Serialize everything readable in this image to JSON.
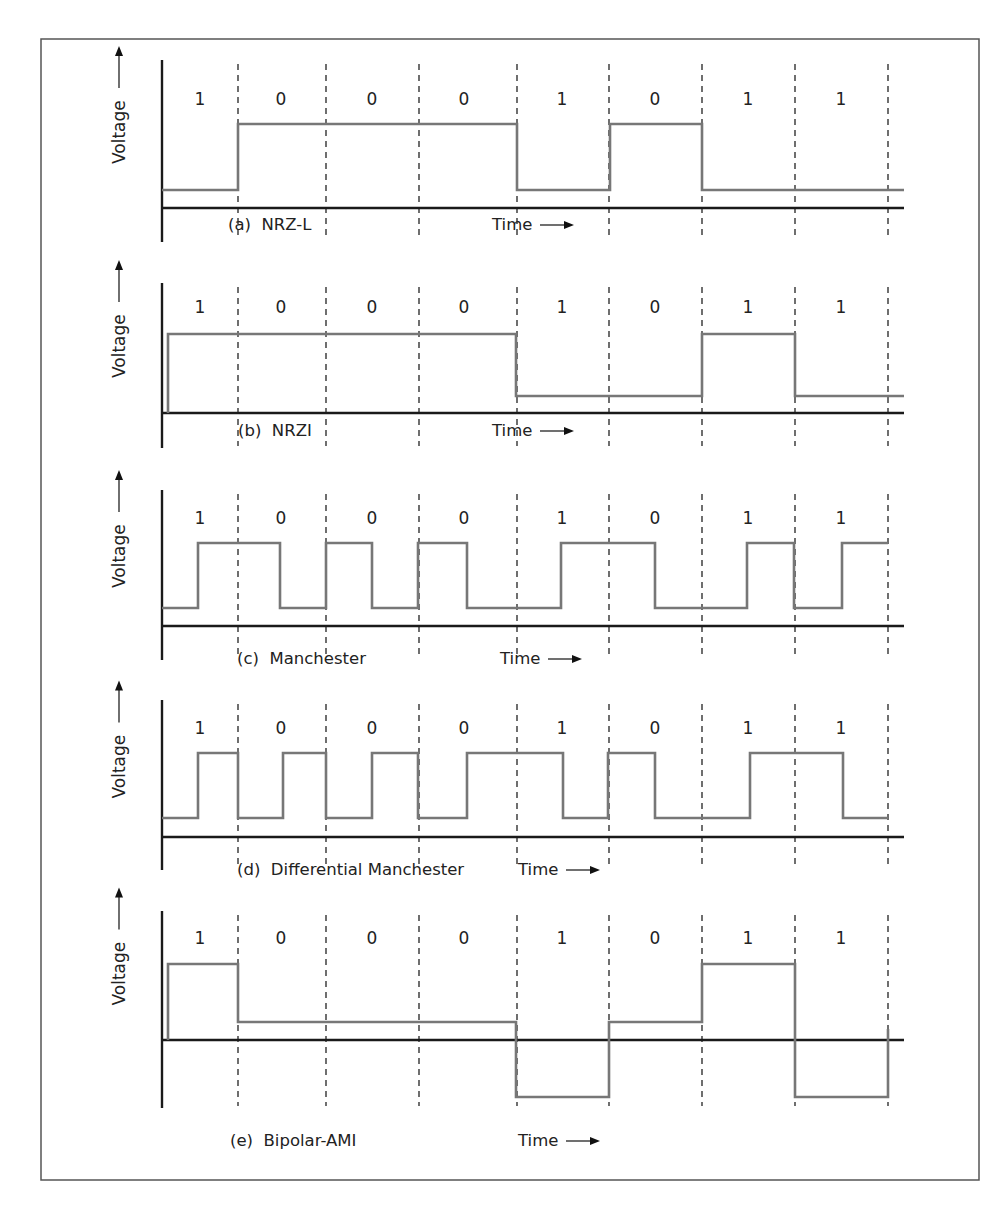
{
  "figure": {
    "y_axis_label": "Voltage",
    "x_axis_label": "Time",
    "bit_sequence": [
      "1",
      "0",
      "0",
      "0",
      "1",
      "0",
      "1",
      "1"
    ],
    "colors": {
      "waveform": "#777777",
      "axis": "#1a1a1a",
      "frame": "#555555",
      "text": "#222222"
    }
  },
  "chart_data": [
    {
      "type": "line",
      "title": "(a) NRZ-L",
      "xlabel": "Time",
      "ylabel": "Voltage",
      "categories": [
        "1",
        "0",
        "0",
        "0",
        "1",
        "0",
        "1",
        "1"
      ],
      "levels": [
        "low",
        "high",
        "high",
        "high",
        "low",
        "high",
        "low",
        "low"
      ]
    },
    {
      "type": "line",
      "title": "(b) NRZI",
      "xlabel": "Time",
      "ylabel": "Voltage",
      "categories": [
        "1",
        "0",
        "0",
        "0",
        "1",
        "0",
        "1",
        "1"
      ],
      "levels": [
        "high",
        "high",
        "high",
        "high",
        "low",
        "low",
        "high",
        "low"
      ]
    },
    {
      "type": "line",
      "title": "(c) Manchester",
      "xlabel": "Time",
      "ylabel": "Voltage",
      "categories": [
        "1",
        "0",
        "0",
        "0",
        "1",
        "0",
        "1",
        "1"
      ],
      "half_bit_levels": [
        "low",
        "high",
        "high",
        "low",
        "high",
        "low",
        "high",
        "low",
        "low",
        "high",
        "high",
        "low",
        "low",
        "high",
        "low",
        "high"
      ]
    },
    {
      "type": "line",
      "title": "(d) Differential Manchester",
      "xlabel": "Time",
      "ylabel": "Voltage",
      "categories": [
        "1",
        "0",
        "0",
        "0",
        "1",
        "0",
        "1",
        "1"
      ],
      "half_bit_levels": [
        "low",
        "high",
        "low",
        "high",
        "low",
        "high",
        "low",
        "high",
        "high",
        "low",
        "high",
        "low",
        "low",
        "high",
        "high",
        "low"
      ]
    },
    {
      "type": "line",
      "title": "(e) Bipolar-AMI",
      "xlabel": "Time",
      "ylabel": "Voltage",
      "categories": [
        "1",
        "0",
        "0",
        "0",
        "1",
        "0",
        "1",
        "1"
      ],
      "levels": [
        "positive",
        "zero",
        "zero",
        "zero",
        "negative",
        "zero",
        "positive",
        "negative"
      ]
    }
  ],
  "panels": [
    {
      "id": "a",
      "caption": "(a)  NRZ-L",
      "time_label": "Time",
      "top": 60,
      "bitY": 99,
      "high": 124,
      "low": 190,
      "base": 208,
      "axisBottom": 242,
      "captionY": 230,
      "captionX": 228,
      "timeX": 492,
      "path": "M162,190 H238 V124 H517 V190 H610 V124 H702 V190 H904"
    },
    {
      "id": "b",
      "caption": "(b)  NRZI",
      "time_label": "Time",
      "top": 283,
      "bitY": 307,
      "high": 334,
      "low": 396,
      "base": 413,
      "axisBottom": 448,
      "captionY": 436,
      "captionX": 238,
      "timeX": 492,
      "path": "M168,413 V334 H516 V396 H702 V334 H795 V396 H904"
    },
    {
      "id": "c",
      "caption": "(c)  Manchester",
      "time_label": "Time",
      "top": 490,
      "bitY": 518,
      "high": 543,
      "low": 608,
      "base": 626,
      "axisBottom": 660,
      "captionY": 664,
      "captionX": 237,
      "timeX": 500,
      "path": "M162,608 H198 V543 H280 V608 H326 V543 H372 V608 H418 V543 H467 V608 H561 V543 H655 V608 H747 V543 H794 V608 H842 V543 H888"
    },
    {
      "id": "d",
      "caption": "(d)  Differential Manchester",
      "time_label": "Time",
      "top": 700,
      "bitY": 728,
      "high": 753,
      "low": 818,
      "base": 837,
      "axisBottom": 870,
      "captionY": 875,
      "captionX": 237,
      "timeX": 518,
      "path": "M162,818 H198 V753 H238 V818 H283 V753 H326 V818 H372 V753 H418 V818 H467 V753 H563 V818 H608 V753 H655 V818 H750 V753 H843 V818 H888"
    },
    {
      "id": "e",
      "caption": "(e)  Bipolar-AMI",
      "time_label": "Time",
      "top": 911,
      "bitY": 938,
      "high": 964,
      "low": 1022,
      "base": 1040,
      "axisBottom": 1108,
      "captionY": 1146,
      "captionX": 230,
      "timeX": 518,
      "path": "M168,1040 V964 H238 V1022 H516 V1097 H609 V1022 H702 V964 H795 V1097 H888 V1029"
    }
  ],
  "dash_x": [
    238,
    326,
    419,
    517,
    609,
    702,
    795,
    888
  ],
  "bit_centers_x": [
    200,
    281,
    372,
    464,
    562,
    655,
    748,
    841
  ]
}
